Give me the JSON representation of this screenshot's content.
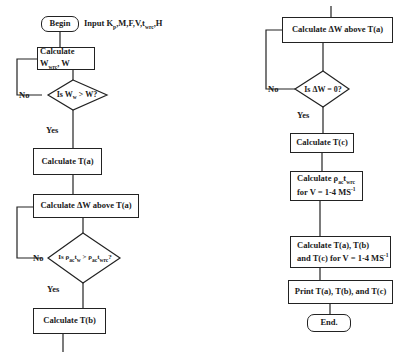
{
  "flowchart": {
    "left_column": {
      "begin": "Begin",
      "input": {
        "prefix": "Input K",
        "k_sub": "p",
        "mid": ",M,F,V,t",
        "t_sub": "wrc",
        "suffix": ",H"
      },
      "calc_w": {
        "prefix": "Calculate W",
        "sub": "wrc",
        "suffix": ", W"
      },
      "decision_1": {
        "prefix": "Is W",
        "sub": "w",
        "suffix": " > W?"
      },
      "decision_1_no": "No",
      "decision_1_yes": "Yes",
      "calc_ta": "Calculate T(a)",
      "calc_dw": "Calculate ΔW above T(a)",
      "decision_2": {
        "p1": "Is ρ",
        "p1_sub": "ac",
        "t1": "t",
        "t1_sub": "w",
        "op": " > ρ",
        "p2_sub": "ac",
        "t2": "t",
        "t2_sub": "wrc",
        "end": "?"
      },
      "decision_2_no": "No",
      "decision_2_yes": "Yes",
      "calc_tb": "Calculate T(b)"
    },
    "right_column": {
      "calc_dw": "Calculate ΔW above T(a)",
      "decision_3": "Is ΔW = 0?",
      "decision_3_no": "No",
      "decision_3_yes": "Yes",
      "calc_tc": "Calculate T(c)",
      "calc_rho": {
        "line1_prefix": "Calculate ρ",
        "rho_sub": "ac",
        "t": "t",
        "t_sub": "wrc",
        "line2_prefix": "for V = 1-4 MS",
        "line2_sup": "-1"
      },
      "calc_all": {
        "line1": "Calculate T(a), T(b)",
        "line2_prefix": "and T(c) for V = 1-4 MS",
        "line2_sup": "-1"
      },
      "print": "Print T(a), T(b), and T(c)",
      "end": "End."
    }
  }
}
